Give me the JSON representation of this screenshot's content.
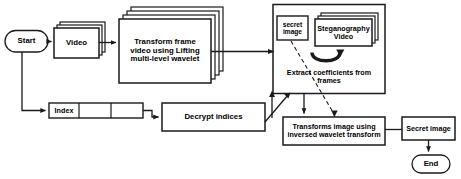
{
  "diagram": {
    "colors": {
      "stroke": "#1a1a1a",
      "fill": "#ffffff",
      "text": "#000000"
    },
    "nodes": {
      "start": {
        "label": "Start",
        "shape": "terminator"
      },
      "video": {
        "label": "Video",
        "shape": "stack"
      },
      "transform_frames": {
        "label": "Transform frame\nvideo using Lifting\nmulti-level wavelet",
        "shape": "stack"
      },
      "secret_image_small": {
        "label": "secret\nimage",
        "shape": "rect"
      },
      "steganography_video": {
        "label": "Steganography\nVideo",
        "shape": "stack"
      },
      "extract_coefficients": {
        "label": "Extract coefficients from\nframes",
        "shape": "group-caption"
      },
      "index_table": {
        "shape": "table",
        "cells": [
          "Index",
          "",
          ""
        ]
      },
      "decrypt_indices": {
        "label": "Decrypt indices",
        "shape": "rect"
      },
      "inverse_transform": {
        "label": "Transforms image using\ninversed wavelet transform",
        "shape": "rect"
      },
      "secret_image_result": {
        "label": "Secret image",
        "shape": "rect"
      },
      "end": {
        "label": "End",
        "shape": "terminator"
      }
    },
    "connector_icons": {
      "curved_arrow": "curved-arrow-icon",
      "dashed_link": "dashed-connector-icon"
    }
  }
}
